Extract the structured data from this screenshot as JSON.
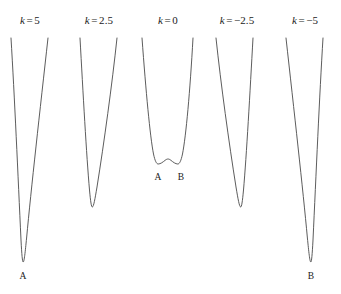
{
  "figure": {
    "background_color": "#ffffff",
    "curve_color": "#4a4a4a",
    "curve_width": 0.9,
    "width": 341,
    "height": 294
  },
  "panels": [
    {
      "id": "panel-k-5",
      "title_var": "k",
      "title_op": "=",
      "title_value": "5",
      "title_x": 30,
      "title_y": 14,
      "well_labels": [
        {
          "text": "A",
          "x": 23,
          "y": 271
        }
      ]
    },
    {
      "id": "panel-k-2.5",
      "title_var": "k",
      "title_op": "=",
      "title_value": "2.5",
      "title_x": 99,
      "title_y": 14,
      "well_labels": []
    },
    {
      "id": "panel-k-0",
      "title_var": "k",
      "title_op": "=",
      "title_value": "0",
      "title_x": 168,
      "title_y": 14,
      "well_labels": [
        {
          "text": "A",
          "x": 158,
          "y": 172
        },
        {
          "text": "B",
          "x": 181,
          "y": 172
        }
      ]
    },
    {
      "id": "panel-k--2.5",
      "title_var": "k",
      "title_op": "=",
      "title_value": "−2.5",
      "title_x": 237,
      "title_y": 14,
      "well_labels": []
    },
    {
      "id": "panel-k--5",
      "title_var": "k",
      "title_op": "=",
      "title_value": "−5",
      "title_x": 305,
      "title_y": 14,
      "well_labels": [
        {
          "text": "B",
          "x": 311,
          "y": 271
        }
      ]
    }
  ],
  "chart_data": {
    "type": "line",
    "title": "",
    "xlabel": "",
    "ylabel": "",
    "grid": false,
    "legend_position": "none",
    "axes_visible": false,
    "series": [
      {
        "name": "k = 5",
        "k": 5,
        "minima_px": [
          [
            23,
            262
          ]
        ],
        "maxima_px": [],
        "top_left_px": [
          11,
          38
        ],
        "top_right_px": [
          48,
          38
        ],
        "path": "M 11 38 C 14.5 95, 18 176, 21 240 C 21.8 255, 22.4 262, 23.2 262 C 24.2 262, 25.2 252, 26.6 238 C 31 190, 40 110, 48 38"
      },
      {
        "name": "k = 2.5",
        "k": 2.5,
        "minima_px": [
          [
            92,
            207
          ]
        ],
        "maxima_px": [],
        "top_left_px": [
          80,
          38
        ],
        "top_right_px": [
          117,
          38
        ],
        "path": "M 80 38 C 83 92, 86.5 156, 89.5 190 C 90.6 202, 91.4 207, 92.3 207 C 93.6 207, 95 199, 97 187 C 104 143, 112 85, 117 38"
      },
      {
        "name": "k = 0",
        "k": 0,
        "minima_px": [
          [
            158,
            164
          ],
          [
            178,
            164
          ]
        ],
        "maxima_px": [
          [
            168,
            159
          ]
        ],
        "top_left_px": [
          142,
          38
        ],
        "top_right_px": [
          193,
          38
        ],
        "path": "M 142 38 C 146 92, 150 136, 153.5 154 C 155 161, 156.5 164, 158.2 164 C 160.5 164, 163 162, 165 160.4 C 166.2 159.4, 167.2 159, 168 159 C 168.8 159, 169.8 159.4, 171 160.4 C 173 162, 175.5 164, 177.8 164 C 179.5 164, 181 161, 182.5 154 C 186 136, 190 92, 193 38"
      },
      {
        "name": "k = -2.5",
        "k": -2.5,
        "minima_px": [
          [
            242,
            207
          ]
        ],
        "maxima_px": [],
        "top_left_px": [
          216,
          38
        ],
        "top_right_px": [
          253,
          38
        ],
        "path": "M 216 38 C 221 85, 229 143, 236 187 C 238 199, 239.4 207, 240.7 207 C 241.6 207, 242.4 202, 243.5 190 C 246.5 156, 250 92, 253 38"
      },
      {
        "name": "k = -5",
        "k": -5,
        "minima_px": [
          [
            311,
            262
          ]
        ],
        "maxima_px": [],
        "top_left_px": [
          286,
          38
        ],
        "top_right_px": [
          323,
          38
        ],
        "path": "M 286 38 C 294 110, 303 190, 307.4 238 C 308.8 252, 309.8 262, 310.8 262 C 311.6 262, 312.2 255, 313 240 C 316 176, 319.5 95, 323 38"
      }
    ]
  }
}
